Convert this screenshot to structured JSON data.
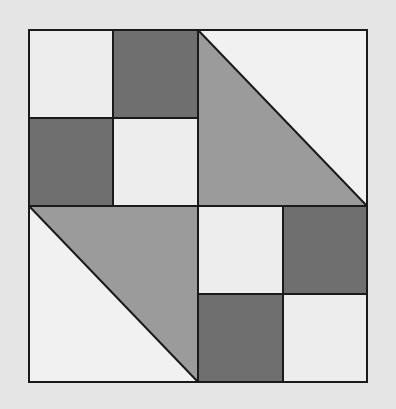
{
  "diagram": {
    "type": "quilt-block",
    "colors": {
      "background": "#e5e5e5",
      "light": "#ededed",
      "white": "#f1f1f1",
      "dark": "#6f6f6f",
      "medium": "#9b9b9b",
      "outline": "#1a1a1a"
    },
    "quadrants": [
      {
        "position": "top-left",
        "kind": "four-patch",
        "cells": [
          "light",
          "dark",
          "dark",
          "light"
        ]
      },
      {
        "position": "top-right",
        "kind": "half-square-triangle",
        "upper_right": "white",
        "lower_left": "medium"
      },
      {
        "position": "bottom-left",
        "kind": "half-square-triangle",
        "upper_right": "medium",
        "lower_left": "white"
      },
      {
        "position": "bottom-right",
        "kind": "four-patch",
        "cells": [
          "light",
          "dark",
          "dark",
          "light"
        ]
      }
    ]
  }
}
